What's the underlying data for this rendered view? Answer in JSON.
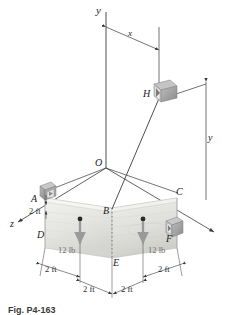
{
  "figure": {
    "type": "statics-free-body-diagram",
    "caption": "Fig. P4-163"
  },
  "axes": {
    "y_label": "y",
    "x_label": "x",
    "z_label": "z",
    "origin_label": "O"
  },
  "points": {
    "A": "A",
    "B": "B",
    "C": "C",
    "D": "D",
    "E": "E",
    "F": "F",
    "H": "H"
  },
  "dimensions": {
    "x_dim": "x",
    "y_dim": "y",
    "az_2ft": "2 ft",
    "left_lower_2ft": "2 ft",
    "left_bottom_2ft": "2 ft",
    "right_bottom_2ft": "2 ft",
    "right_lower_2ft": "2 ft"
  },
  "loads": {
    "left": "12 lb",
    "right": "12 lb"
  },
  "colors": {
    "line": "#3a3a3a",
    "plate_light": "#e9e9e7",
    "plate_dark": "#d8d8d4",
    "load_arrow": "#9a9a9a",
    "support": "#8e8e8e",
    "text": "#1a1a1a"
  }
}
